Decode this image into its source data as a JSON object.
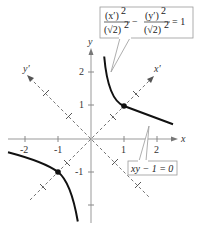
{
  "diagram": {
    "axes": {
      "x_label": "x",
      "y_label": "y",
      "x_prime_label": "x′",
      "y_prime_label": "y′",
      "x_ticks": [
        "-2",
        "-1",
        "1",
        "2"
      ],
      "y_ticks": [
        "2",
        "1",
        "-1"
      ],
      "x_range": [
        -2.5,
        2.5
      ],
      "y_range": [
        -2.5,
        2.5
      ]
    },
    "equations": {
      "rotated_form": {
        "num1": "(x′)",
        "num1_exp": "2",
        "den1": "(√2)",
        "den1_exp": "2",
        "minus": "−",
        "num2": "(y′)",
        "num2_exp": "2",
        "den2": "(√2)",
        "den2_exp": "2",
        "rhs": "= 1"
      },
      "standard_form": "xy − 1 = 0"
    },
    "vertices": [
      {
        "x": 1,
        "y": 1
      },
      {
        "x": -1,
        "y": -1
      }
    ],
    "colors": {
      "curve": "#111111",
      "axis": "#999999",
      "rotated_axis": "#666666",
      "box_border": "#999999",
      "text": "#333333"
    }
  }
}
